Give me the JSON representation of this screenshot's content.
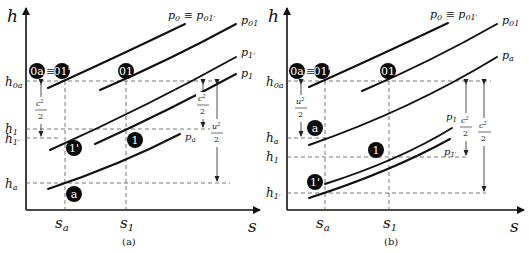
{
  "figure": {
    "panels": [
      {
        "caption": "(a)",
        "axis": {
          "y_label": "h",
          "x_label": "s"
        },
        "y_ticks": [
          {
            "base": "h",
            "sub": "0a"
          },
          {
            "base": "h",
            "sub": "1"
          },
          {
            "base": "h",
            "sub": "1′"
          },
          {
            "base": "h",
            "sub": "a"
          }
        ],
        "x_ticks": [
          {
            "base": "s",
            "sub": "a"
          },
          {
            "base": "s",
            "sub": "1"
          }
        ],
        "isobars": [
          {
            "base": "p",
            "sub": "0",
            "suffix": " ≡ p",
            "suffix_sub": "01′"
          },
          {
            "base": "p",
            "sub": "01"
          },
          {
            "base": "p",
            "sub": "1′"
          },
          {
            "base": "p",
            "sub": "1"
          },
          {
            "base": "p",
            "sub": "a"
          }
        ],
        "states": {
          "s0a": "0a",
          "equiv": "≡",
          "s01p": "01'",
          "s01": "01",
          "s1p": "1'",
          "s1": "1",
          "sa": "a"
        },
        "deltas": [
          {
            "num": "c",
            "num_sub": "1′",
            "num_sup": "2",
            "den": "2"
          },
          {
            "num": "c",
            "num_sub": "1",
            "num_sup": "2",
            "den": "2"
          },
          {
            "num": "u",
            "num_sup": "2",
            "den": "2"
          }
        ]
      },
      {
        "caption": "(b)",
        "axis": {
          "y_label": "h",
          "x_label": "s"
        },
        "y_ticks": [
          {
            "base": "h",
            "sub": "0a"
          },
          {
            "base": "h",
            "sub": "a"
          },
          {
            "base": "h",
            "sub": "1"
          },
          {
            "base": "h",
            "sub": "1′"
          }
        ],
        "x_ticks": [
          {
            "base": "s",
            "sub": "a"
          },
          {
            "base": "s",
            "sub": "1"
          }
        ],
        "isobars": [
          {
            "base": "p",
            "sub": "0",
            "suffix": " ≡ p",
            "suffix_sub": "01′"
          },
          {
            "base": "p",
            "sub": "01"
          },
          {
            "base": "p",
            "sub": "a"
          },
          {
            "base": "p",
            "sub": "1"
          },
          {
            "base": "p",
            "sub": "1′"
          }
        ],
        "states": {
          "s0a": "0a",
          "equiv": "≡",
          "s01p": "01'",
          "s01": "01",
          "sa": "a",
          "s1": "1",
          "s1p": "1'"
        },
        "deltas": [
          {
            "num": "u",
            "num_sup": "2",
            "den": "2"
          },
          {
            "num": "c",
            "num_sub": "1",
            "num_sup": "2",
            "den": "2"
          },
          {
            "num": "c",
            "num_sub": "1′",
            "num_sup": "2",
            "den": "2"
          }
        ]
      }
    ]
  }
}
